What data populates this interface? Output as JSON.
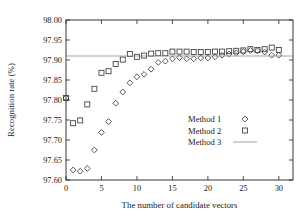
{
  "chart_data": {
    "type": "scatter",
    "title": "",
    "xlabel": "The number of candidate vectors",
    "ylabel": "Recognition rate (%)",
    "xlim": [
      0,
      32
    ],
    "ylim": [
      97.6,
      98.0
    ],
    "xticks": [
      0,
      5,
      10,
      15,
      20,
      25,
      30
    ],
    "xticklabels": [
      "0",
      "5",
      "10",
      "15",
      "20",
      "25",
      "30"
    ],
    "yticks": [
      97.6,
      97.65,
      97.7,
      97.75,
      97.8,
      97.85,
      97.9,
      97.95,
      98.0
    ],
    "yticklabels": [
      "97.60",
      "97.65",
      "97.70",
      "97.75",
      "97.80",
      "97.85",
      "97.90",
      "97.95",
      "98.00"
    ],
    "grid": false,
    "legend_position": "center-right",
    "series": [
      {
        "name": "Method 1",
        "marker": "diamond",
        "x": [
          0,
          1,
          2,
          3,
          4,
          5,
          6,
          7,
          8,
          9,
          10,
          11,
          12,
          13,
          14,
          15,
          16,
          17,
          18,
          19,
          20,
          21,
          22,
          23,
          24,
          25,
          26,
          27,
          28,
          29,
          30
        ],
        "values": [
          97.805,
          97.625,
          97.622,
          97.629,
          97.675,
          97.719,
          97.746,
          97.792,
          97.82,
          97.843,
          97.858,
          97.864,
          97.877,
          97.894,
          97.897,
          97.903,
          97.906,
          97.903,
          97.903,
          97.905,
          97.905,
          97.908,
          97.912,
          97.915,
          97.918,
          97.921,
          97.924,
          97.923,
          97.92,
          97.912,
          97.912
        ]
      },
      {
        "name": "Method 2",
        "marker": "square",
        "x": [
          0,
          1,
          2,
          3,
          4,
          5,
          6,
          7,
          8,
          9,
          10,
          11,
          12,
          13,
          14,
          15,
          16,
          17,
          18,
          19,
          20,
          21,
          22,
          23,
          24,
          25,
          26,
          27,
          28,
          29,
          30
        ],
        "values": [
          97.805,
          97.742,
          97.749,
          97.789,
          97.828,
          97.868,
          97.872,
          97.89,
          97.901,
          97.915,
          97.908,
          97.911,
          97.916,
          97.917,
          97.917,
          97.921,
          97.921,
          97.921,
          97.92,
          97.92,
          97.92,
          97.921,
          97.921,
          97.922,
          97.923,
          97.924,
          97.927,
          97.925,
          97.927,
          97.931,
          97.925
        ]
      },
      {
        "name": "Method 3",
        "marker": "line",
        "constant_value": 97.91
      }
    ]
  },
  "legend": {
    "entries": [
      {
        "label": "Method 1",
        "marker": "diamond"
      },
      {
        "label": "Method 2",
        "marker": "square"
      },
      {
        "label": "Method 3",
        "marker": "line"
      }
    ]
  }
}
